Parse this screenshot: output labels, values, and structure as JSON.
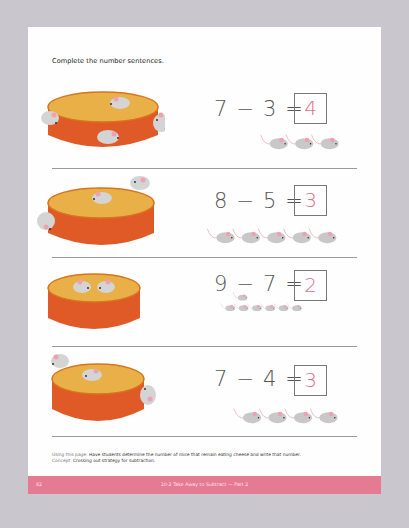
{
  "page": {
    "instructions": "Complete the number sentences.",
    "colors": {
      "background": "#c9c7cd",
      "paper": "#fefefe",
      "footer_bar": "#e57a93",
      "cheese_top": "#e8b046",
      "cheese_side": "#e05a28",
      "mouse_body": "#c8c8c8",
      "mouse_ear": "#f0a0b0",
      "answer_ink": "#e0708a"
    },
    "problems": [
      {
        "minuend": "7",
        "operator": "−",
        "subtrahend": "3",
        "equals": "=",
        "answer": "4",
        "mice_away": 3,
        "mice_on_cheese": 4
      },
      {
        "minuend": "8",
        "operator": "−",
        "subtrahend": "5",
        "equals": "=",
        "answer": "3",
        "mice_away": 5,
        "mice_on_cheese": 3
      },
      {
        "minuend": "9",
        "operator": "−",
        "subtrahend": "7",
        "equals": "=",
        "answer": "2",
        "mice_away": 7,
        "mice_on_cheese": 2
      },
      {
        "minuend": "7",
        "operator": "−",
        "subtrahend": "4",
        "equals": "=",
        "answer": "3",
        "mice_away": 4,
        "mice_on_cheese": 3
      }
    ],
    "notes": {
      "using_label": "Using this page:",
      "using_text": "Have students determine the number of mice that remain eating cheese and write that number.",
      "concept_label": "Concept:",
      "concept_text": "Crossing out strategy for subtraction."
    },
    "footer": {
      "page_number": "82",
      "title": "10-2 Take Away to Subtract — Part 2"
    }
  }
}
